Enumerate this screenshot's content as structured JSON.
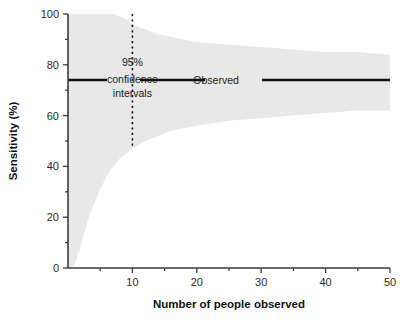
{
  "chart_data": {
    "type": "area",
    "title": "",
    "subtitle": "",
    "xlabel": "Number of people observed",
    "ylabel": "Sensitivity (%)",
    "xlim": [
      0,
      50
    ],
    "ylim": [
      0,
      100
    ],
    "grid": false,
    "legend_position": "inline-annotation",
    "x_ticks": [
      10,
      20,
      30,
      40,
      50
    ],
    "x_tick_labels": [
      "10",
      "20",
      "30",
      "40",
      "50"
    ],
    "x_minor_ticks": [
      5,
      15,
      25,
      35,
      45
    ],
    "y_ticks": [
      0,
      20,
      40,
      60,
      80,
      100
    ],
    "y_tick_labels": [
      "0",
      "20",
      "40",
      "60",
      "80",
      "100"
    ],
    "y_minor_ticks": [
      10,
      30,
      50,
      70,
      90
    ],
    "series": [
      {
        "name": "Observed",
        "type": "line",
        "value": 74,
        "x": [
          0,
          50
        ],
        "values": [
          74,
          74
        ]
      },
      {
        "name": "95% confidence intervals",
        "type": "band",
        "x": [
          1,
          2,
          3,
          4,
          5,
          6,
          7,
          8,
          9,
          10,
          12,
          14,
          16,
          18,
          20,
          25,
          30,
          35,
          40,
          45,
          50
        ],
        "upper": [
          100,
          100,
          100,
          100,
          100,
          100,
          100,
          99,
          98,
          96,
          94,
          92,
          91,
          90,
          89,
          88,
          87,
          86,
          85,
          85,
          84
        ],
        "lower": [
          1,
          9,
          18,
          25,
          31,
          36,
          40,
          43,
          45,
          47,
          50,
          52,
          54,
          55,
          56,
          58,
          59,
          60,
          61,
          62,
          62
        ]
      }
    ],
    "annotations": [
      {
        "name": "ci-label",
        "text_lines": [
          "95%",
          "confidence",
          "intervals"
        ],
        "x": 10,
        "y": 76
      },
      {
        "name": "observed-label",
        "text": "Observed",
        "x": 23,
        "y": 74
      },
      {
        "name": "ci-reference-line",
        "x": 10,
        "y_from": 47,
        "y_to": 100
      }
    ],
    "colors": {
      "band": "#e8e8e8",
      "observed_line": "#111111",
      "axis": "#3b3b3b",
      "background": "#ffffff"
    }
  }
}
